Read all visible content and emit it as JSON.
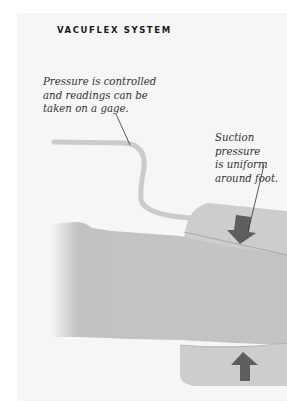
{
  "heading": "VACUFLEX SYSTEM",
  "captions": [
    {
      "text": "Pressure is controlled\nand readings can be\ntaken on a gage."
    },
    {
      "text": "Suction pressure\nis uniform\naround foot."
    }
  ],
  "illustration": {
    "subject": "leg in suction cuff with pressure tube",
    "arrows": [
      {
        "direction": "down",
        "position": "top-cuff"
      },
      {
        "direction": "up",
        "position": "bottom-cuff"
      }
    ],
    "colors": {
      "page_bg": "#f6f6f6",
      "leg": "#c2c2c2",
      "cuff": "#cdcdcd",
      "tube": "#cbcbcb",
      "arrow": "#5e5e5e",
      "leader_line": "#333333"
    }
  }
}
